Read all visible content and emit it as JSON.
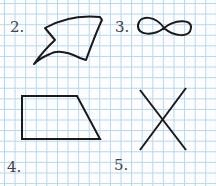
{
  "figures": [
    {
      "number": "2.",
      "shape": "curved-arrowhead-shape"
    },
    {
      "number": "3.",
      "shape": "infinity-loop"
    },
    {
      "number": "4.",
      "shape": "trapezoid"
    },
    {
      "number": "5.",
      "shape": "crossing-lines-x"
    }
  ],
  "colors": {
    "grid": "#b9d6e8",
    "stroke": "#1a1a1a",
    "label": "#444444"
  }
}
